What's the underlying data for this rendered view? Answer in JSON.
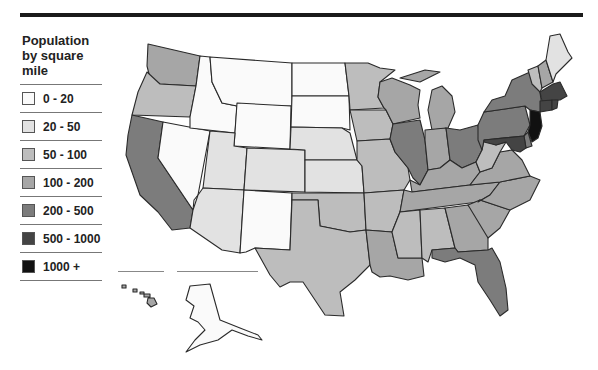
{
  "legend": {
    "title_lines": [
      "Population",
      "by square",
      "mile"
    ],
    "items": [
      {
        "label": "0 - 20",
        "color": "#fafafa"
      },
      {
        "label": "20 - 50",
        "color": "#e2e2e2"
      },
      {
        "label": "50 - 100",
        "color": "#bdbdbd"
      },
      {
        "label": "100 - 200",
        "color": "#a6a6a6"
      },
      {
        "label": "200 - 500",
        "color": "#7c7c7c"
      },
      {
        "label": "500 - 1000",
        "color": "#444444"
      },
      {
        "label": "1000 +",
        "color": "#111111"
      }
    ]
  },
  "map": {
    "title": "Population by square mile",
    "states": {
      "WA": "100 - 200",
      "OR": "50 - 100",
      "CA": "200 - 500",
      "NV": "0 - 20",
      "ID": "0 - 20",
      "MT": "0 - 20",
      "WY": "0 - 20",
      "UT": "20 - 50",
      "AZ": "20 - 50",
      "CO": "20 - 50",
      "NM": "0 - 20",
      "ND": "0 - 20",
      "SD": "0 - 20",
      "NE": "20 - 50",
      "KS": "20 - 50",
      "OK": "50 - 100",
      "TX": "50 - 100",
      "MN": "50 - 100",
      "IA": "50 - 100",
      "MO": "50 - 100",
      "AR": "50 - 100",
      "LA": "100 - 200",
      "WI": "100 - 200",
      "IL": "200 - 500",
      "MI": "100 - 200",
      "IN": "100 - 200",
      "OH": "200 - 500",
      "KY": "100 - 200",
      "TN": "100 - 200",
      "MS": "50 - 100",
      "AL": "50 - 100",
      "GA": "100 - 200",
      "FL": "200 - 500",
      "SC": "100 - 200",
      "NC": "100 - 200",
      "VA": "100 - 200",
      "WV": "50 - 100",
      "PA": "200 - 500",
      "NY": "200 - 500",
      "VT": "50 - 100",
      "NH": "100 - 200",
      "ME": "20 - 50",
      "MA": "500 - 1000",
      "CT": "500 - 1000",
      "RI": "500 - 1000",
      "NJ": "1000 +",
      "DE": "200 - 500",
      "MD": "500 - 1000",
      "AK": "0 - 20",
      "HI": "100 - 200"
    }
  }
}
